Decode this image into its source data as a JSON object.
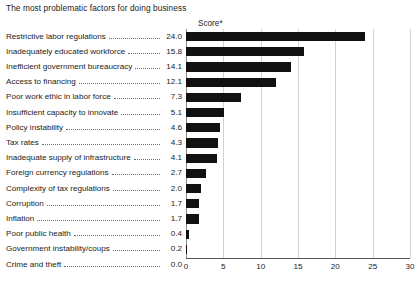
{
  "chart_data": {
    "type": "bar",
    "orientation": "horizontal",
    "title": "The most problematic factors for doing business",
    "value_header": "Score*",
    "xlabel": "",
    "ylabel": "",
    "xlim": [
      0,
      30
    ],
    "xticks": [
      0,
      5,
      10,
      15,
      20,
      25,
      30
    ],
    "xtick_labels": [
      "0",
      "5",
      "10",
      "15",
      "20",
      "25",
      "30"
    ],
    "grid": true,
    "grid_axis": "x",
    "legend": null,
    "bar_color": "#111111",
    "categories": [
      "Restrictive labor regulations",
      "Inadequately educated workforce",
      "Inefficient government bureaucracy",
      "Access to financing",
      "Poor work ethic in labor force",
      "Insufficient capacity to innovate",
      "Policy instability",
      "Tax rates",
      "Inadequate supply of infrastructure",
      "Foreign currency regulations",
      "Complexity of tax regulations",
      "Corruption",
      "Inflation",
      "Poor public health",
      "Government instability/coups",
      "Crime and theft"
    ],
    "values": [
      24.0,
      15.8,
      14.1,
      12.1,
      7.3,
      5.1,
      4.6,
      4.3,
      4.1,
      2.7,
      2.0,
      1.7,
      1.7,
      0.4,
      0.2,
      0.0
    ],
    "value_labels": [
      "24.0",
      "15.8",
      "14.1",
      "12.1",
      "7.3",
      "5.1",
      "4.6",
      "4.3",
      "4.1",
      "2.7",
      "2.0",
      "1.7",
      "1.7",
      "0.4",
      "0.2",
      "0.0"
    ]
  }
}
